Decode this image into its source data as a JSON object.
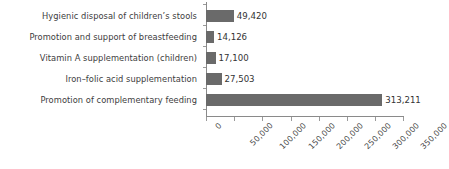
{
  "chart_data": {
    "type": "bar",
    "orientation": "horizontal",
    "title": "",
    "xlabel": "",
    "ylabel": "",
    "categories": [
      "Hygienic disposal of children’s stools",
      "Promotion and support of breastfeeding",
      "Vitamin A supplementation (children)",
      "Iron–folic acid supplementation",
      "Promotion of complementary feeding"
    ],
    "values": [
      49420,
      14126,
      17100,
      27503,
      313211
    ],
    "value_labels": [
      "49,420",
      "14,126",
      "17,100",
      "27,503",
      "313,211"
    ],
    "xlim": [
      0,
      350000
    ],
    "xticks": [
      0,
      50000,
      100000,
      150000,
      200000,
      250000,
      300000,
      350000
    ],
    "xtick_labels": [
      "0",
      "50,000",
      "100,000",
      "150,000",
      "200,000",
      "250,000",
      "300,000",
      "350,000"
    ],
    "grid": false,
    "legend": null,
    "bar_color": "#6a6a6a",
    "axis_color": "#8a8a8a",
    "text_color": "#3d3d3d"
  }
}
